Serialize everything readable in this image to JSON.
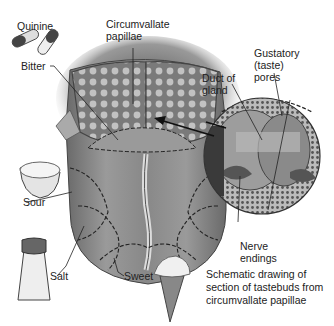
{
  "diagram": {
    "labels": {
      "quinine": "Quinine",
      "circumvallate_line1": "Circumvallate",
      "circumvallate_line2": "papillae",
      "bitter": "Bitter",
      "duct_line1": "Duct of",
      "duct_line2": "gland",
      "gustatory_line1": "Gustatory",
      "gustatory_line2": "(taste)",
      "gustatory_line3": "pores",
      "sour": "Sour",
      "salt": "Salt",
      "sweet": "Sweet",
      "nerve_line1": "Nerve",
      "nerve_line2": "endings"
    },
    "caption": {
      "line1": "Schematic drawing of",
      "line2": "section of tastebuds from",
      "line3": "circumvallate papillae"
    },
    "icons": [
      "quinine-capsules-icon",
      "lemon-icon",
      "salt-shaker-icon",
      "ice-cream-cone-icon"
    ],
    "colors": {
      "tongue": "#8a8a8a",
      "tongue_dark": "#5e5e5e",
      "papillae": "#b8b8b8",
      "leader_line": "#222222"
    }
  }
}
